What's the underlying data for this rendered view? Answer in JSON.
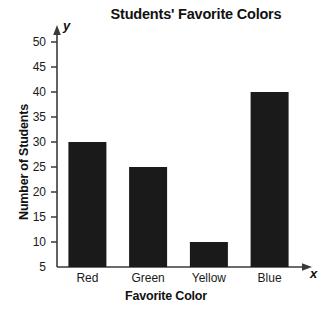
{
  "chart_data": {
    "type": "bar",
    "title": "Students' Favorite Colors",
    "xlabel": "Favorite Color",
    "ylabel": "Number of Students",
    "categories": [
      "Red",
      "Green",
      "Yellow",
      "Blue"
    ],
    "values": [
      30,
      25,
      10,
      40
    ],
    "ylim": [
      5,
      50
    ],
    "ytick_labels": [
      "5",
      "10",
      "15",
      "20",
      "25",
      "30",
      "35",
      "40",
      "45",
      "50"
    ],
    "ytick_values": [
      5,
      10,
      15,
      20,
      25,
      30,
      35,
      40,
      45,
      50
    ],
    "grid": false,
    "legend": "none",
    "bar_color": "#1a1a1a",
    "axis_color": "#3a3a3a",
    "background": "#ffffff",
    "x_axis_name": "x",
    "y_axis_name": "y",
    "axis_arrows": true
  }
}
